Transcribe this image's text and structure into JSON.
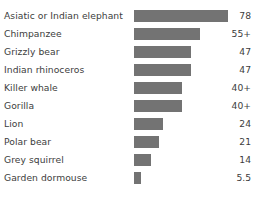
{
  "chart_data": {
    "type": "bar",
    "orientation": "horizontal",
    "title": "",
    "xlabel": "",
    "ylabel": "",
    "grid": false,
    "legend": false,
    "background_color": "#ffffff",
    "bar_color": "#737373",
    "text_color": "#3d3d3d",
    "xlim": [
      0,
      78
    ],
    "categories": [
      "Asiatic or Indian elephant",
      "Chimpanzee",
      "Grizzly bear",
      "Indian rhinoceros",
      "Killer whale",
      "Gorilla",
      "Lion",
      "Polar bear",
      "Grey squirrel",
      "Garden dormouse"
    ],
    "values": [
      78,
      55,
      47,
      47,
      40,
      40,
      24,
      21,
      14,
      5.5
    ],
    "value_labels": [
      "78",
      "55+",
      "47",
      "47",
      "40+",
      "40+",
      "24",
      "21",
      "14",
      "5.5"
    ],
    "rows": [
      {
        "category": "Asiatic or Indian elephant",
        "value": 78,
        "value_label": "78"
      },
      {
        "category": "Chimpanzee",
        "value": 55,
        "value_label": "55+"
      },
      {
        "category": "Grizzly bear",
        "value": 47,
        "value_label": "47"
      },
      {
        "category": "Indian rhinoceros",
        "value": 47,
        "value_label": "47"
      },
      {
        "category": "Killer whale",
        "value": 40,
        "value_label": "40+"
      },
      {
        "category": "Gorilla",
        "value": 40,
        "value_label": "40+"
      },
      {
        "category": "Lion",
        "value": 24,
        "value_label": "24"
      },
      {
        "category": "Polar bear",
        "value": 21,
        "value_label": "21"
      },
      {
        "category": "Grey squirrel",
        "value": 14,
        "value_label": "14"
      },
      {
        "category": "Garden dormouse",
        "value": 5.5,
        "value_label": "5.5"
      }
    ]
  }
}
